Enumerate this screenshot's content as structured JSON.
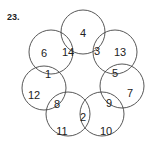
{
  "problem_number": "23.",
  "stroke_color": "#444444",
  "circles": [
    {
      "name": "top",
      "cx": 83,
      "cy": 32,
      "r": 22
    },
    {
      "name": "upper-left",
      "cx": 51,
      "cy": 52,
      "r": 22
    },
    {
      "name": "upper-right",
      "cx": 115,
      "cy": 52,
      "r": 22
    },
    {
      "name": "left",
      "cx": 44,
      "cy": 88,
      "r": 22
    },
    {
      "name": "right",
      "cx": 122,
      "cy": 86,
      "r": 22
    },
    {
      "name": "bottom-left",
      "cx": 68,
      "cy": 114,
      "r": 22
    },
    {
      "name": "bottom-right",
      "cx": 102,
      "cy": 114,
      "r": 22
    }
  ],
  "numbers": [
    {
      "value": "4",
      "x": 83,
      "y": 33
    },
    {
      "value": "6",
      "x": 44,
      "y": 53
    },
    {
      "value": "14",
      "x": 68,
      "y": 52
    },
    {
      "value": "3",
      "x": 97,
      "y": 51
    },
    {
      "value": "13",
      "x": 120,
      "y": 52
    },
    {
      "value": "1",
      "x": 48,
      "y": 74
    },
    {
      "value": "5",
      "x": 115,
      "y": 73
    },
    {
      "value": "12",
      "x": 34,
      "y": 95
    },
    {
      "value": "7",
      "x": 130,
      "y": 93
    },
    {
      "value": "8",
      "x": 57,
      "y": 104
    },
    {
      "value": "9",
      "x": 109,
      "y": 103
    },
    {
      "value": "2",
      "x": 83,
      "y": 117
    },
    {
      "value": "11",
      "x": 62,
      "y": 131
    },
    {
      "value": "10",
      "x": 106,
      "y": 131
    }
  ]
}
